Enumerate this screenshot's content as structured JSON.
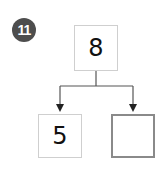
{
  "problem_number": "11",
  "diagram": {
    "type": "number-bond",
    "whole": "8",
    "parts": [
      "5",
      ""
    ]
  },
  "colors": {
    "badge": "#4d4d4d",
    "line": "#555555",
    "box_border_light": "#cfcfcf",
    "box_border_empty": "#8a8a8a"
  }
}
